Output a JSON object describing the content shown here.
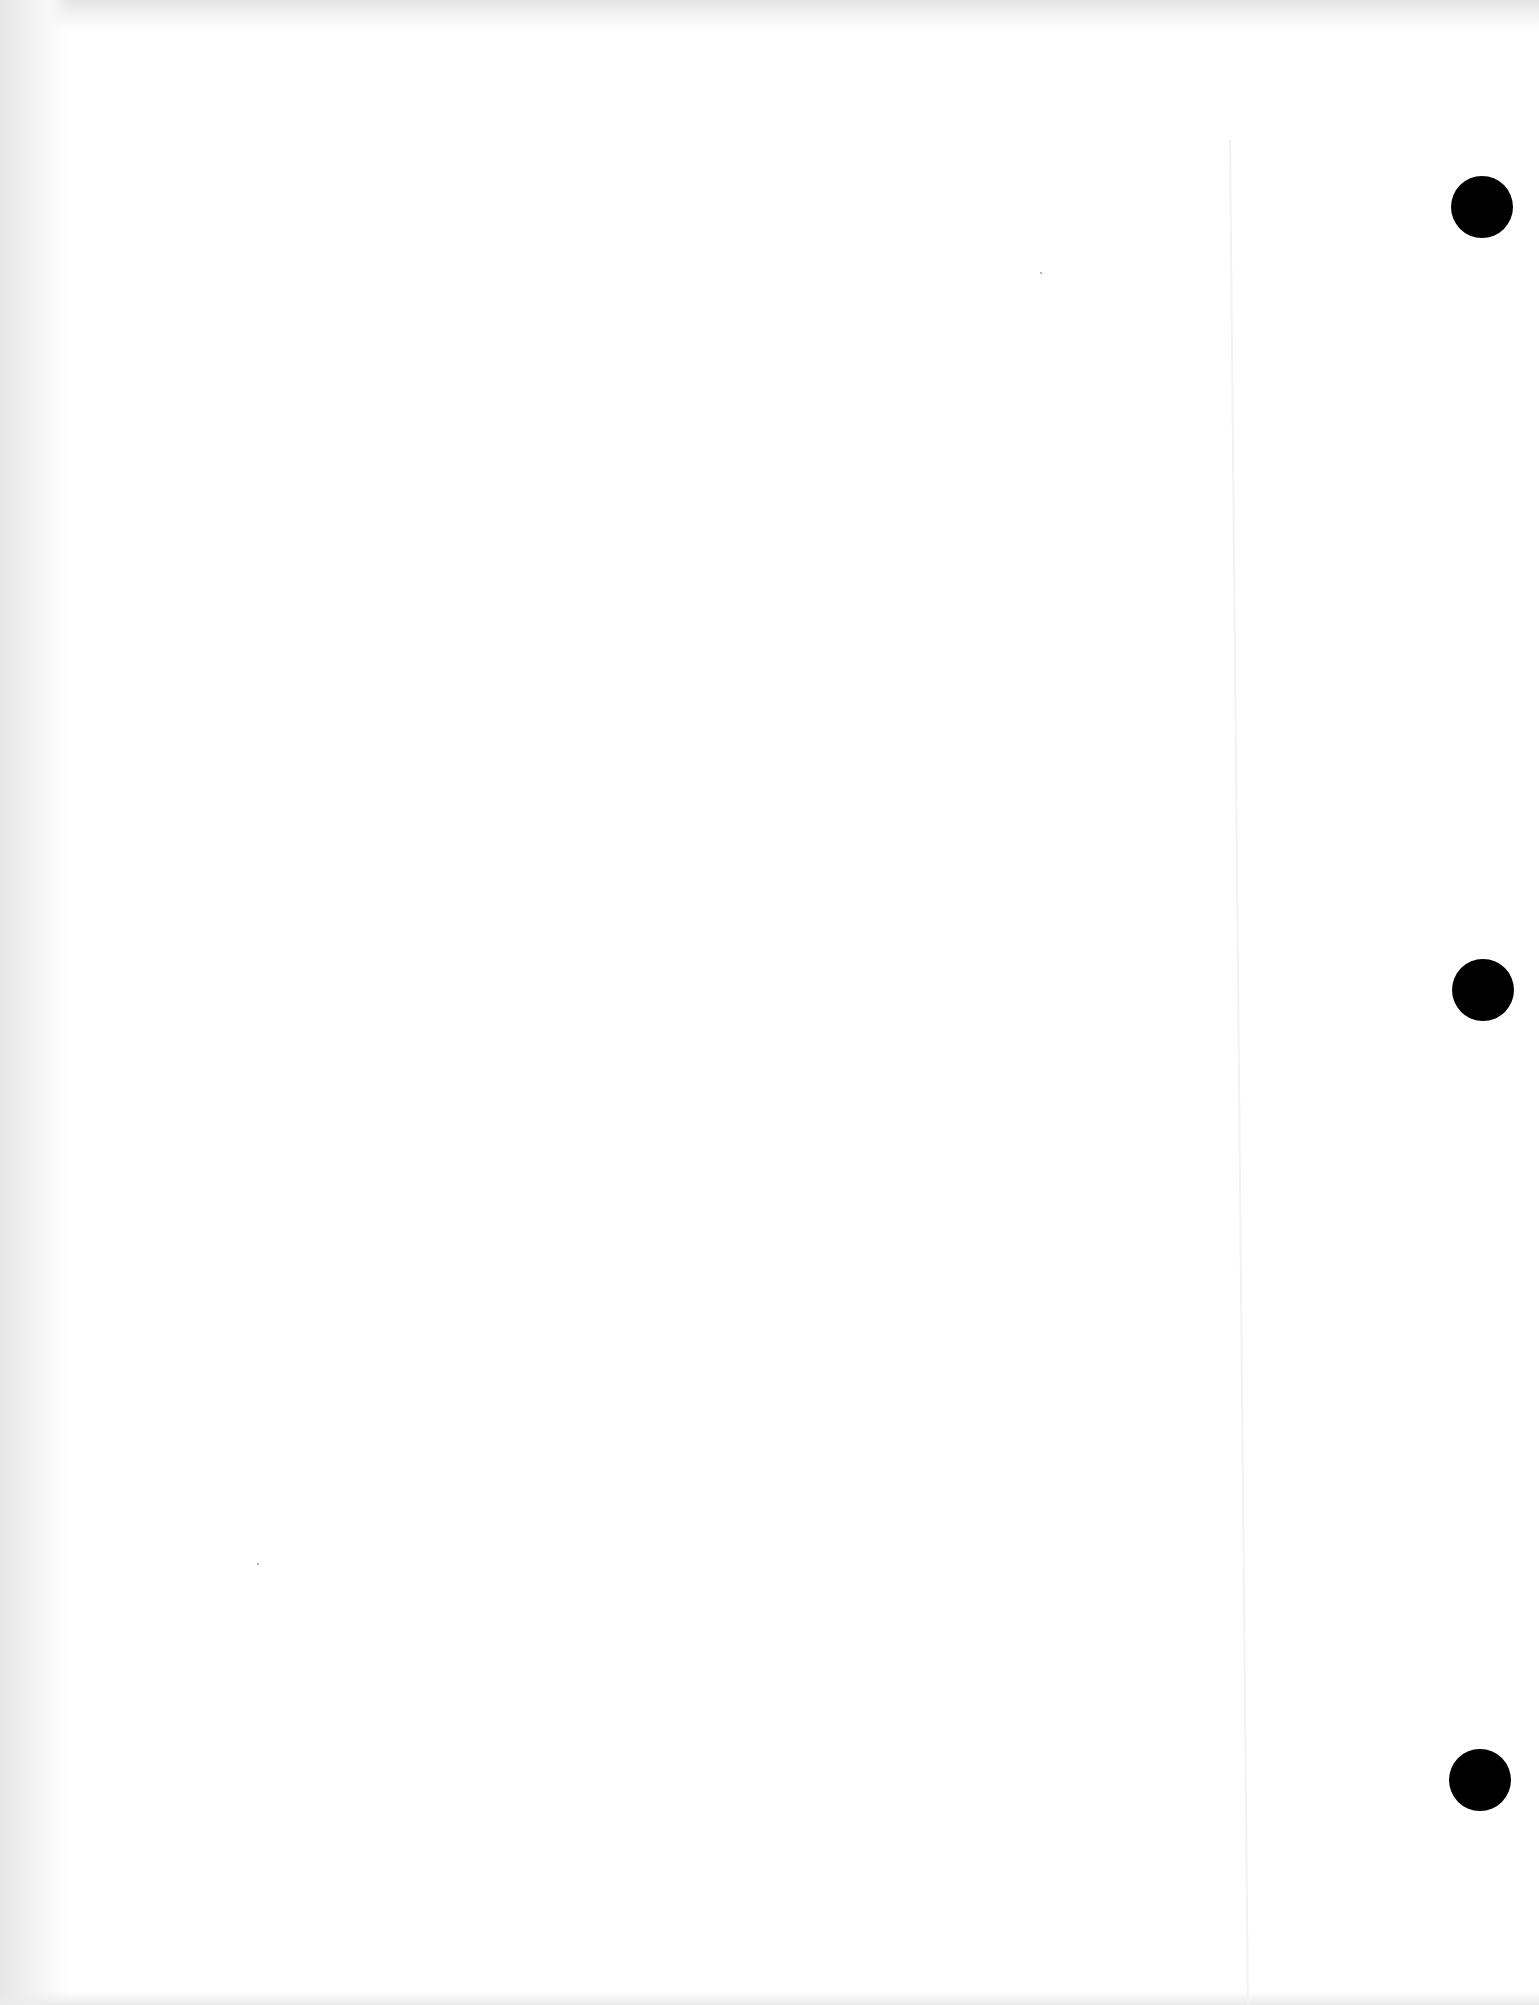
{
  "document": {
    "type": "blank scanned page",
    "text": "",
    "background_color": "#ffffff",
    "punch_holes": [
      {
        "position": "top",
        "center_x": 1482,
        "center_y": 207,
        "diameter": 62,
        "color": "#000000"
      },
      {
        "position": "middle",
        "center_x": 1483,
        "center_y": 990,
        "diameter": 62,
        "color": "#000000"
      },
      {
        "position": "bottom",
        "center_x": 1480,
        "center_y": 1780,
        "diameter": 62,
        "color": "#000000"
      }
    ]
  }
}
